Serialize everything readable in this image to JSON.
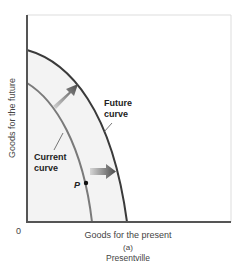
{
  "figure": {
    "panel_label": "(a)",
    "panel_title": "Presentville",
    "x_axis_label": "Goods for the present",
    "y_axis_label": "Goods for the future",
    "origin_label": "0",
    "curves": [
      {
        "name": "Current curve",
        "label_line1": "Current",
        "label_line2": "curve",
        "color": "#7a7a7a"
      },
      {
        "name": "Future curve",
        "label_line1": "Future",
        "label_line2": "curve",
        "color": "#3a3a3a"
      }
    ],
    "point": {
      "label": "P",
      "on_curve": "Current curve"
    },
    "arrows": [
      {
        "direction": "up-right",
        "meaning": "outward shift of curve"
      },
      {
        "direction": "right",
        "meaning": "outward shift of curve"
      }
    ],
    "colors": {
      "axis": "#555555",
      "frame": "#dddddd",
      "shade": "#f2f2f2",
      "future_curve": "#3a3a3a",
      "current_curve": "#7a7a7a",
      "arrow_dark": "#4a4a4a",
      "arrow_light": "#d0d0d0"
    }
  }
}
